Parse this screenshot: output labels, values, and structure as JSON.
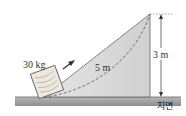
{
  "diagram": {
    "mass_label": "30 kg",
    "incline_length_label": "5 m",
    "height_label": "3 m",
    "ground_label": "지면",
    "colors": {
      "incline_fill": "#d8d8d8",
      "ground_fill": "#9a9a9a",
      "box_fill": "#e8e4dc",
      "line": "#444444"
    }
  }
}
